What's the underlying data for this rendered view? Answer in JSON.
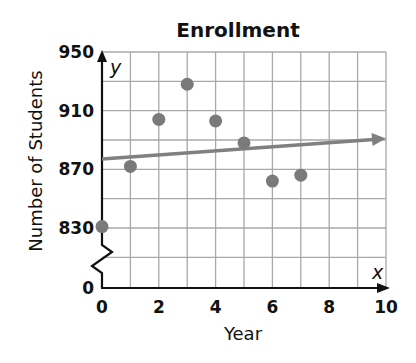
{
  "chart_data": {
    "type": "scatter",
    "title": "Enrollment",
    "xlabel": "Year",
    "ylabel": "Number of Students",
    "x_axis_var": "x",
    "y_axis_var": "y",
    "xlim": [
      0,
      10
    ],
    "ylim": [
      0,
      950
    ],
    "y_axis_break": {
      "from": 0,
      "to": 810
    },
    "x_ticks": [
      "0",
      "2",
      "4",
      "6",
      "8",
      "10"
    ],
    "y_ticks": [
      "0",
      "830",
      "870",
      "910",
      "950"
    ],
    "grid": true,
    "x_grid_step": 1,
    "y_grid_step": 20,
    "series": [
      {
        "name": "Enrollment",
        "x": [
          0,
          1,
          2,
          3,
          4,
          5,
          6,
          7
        ],
        "values": [
          831,
          872,
          904,
          928,
          903,
          888,
          862,
          866
        ]
      }
    ],
    "trend_line": {
      "name": "line of fit",
      "start": {
        "x": 0,
        "y": 877
      },
      "end": {
        "x": 10,
        "y": 891
      },
      "arrow_end": true
    }
  },
  "colors": {
    "grid": "#a8a8a8",
    "points": "#7a7a7a",
    "trend_line": "#808080",
    "axis": "#111111",
    "text": "#111111"
  }
}
